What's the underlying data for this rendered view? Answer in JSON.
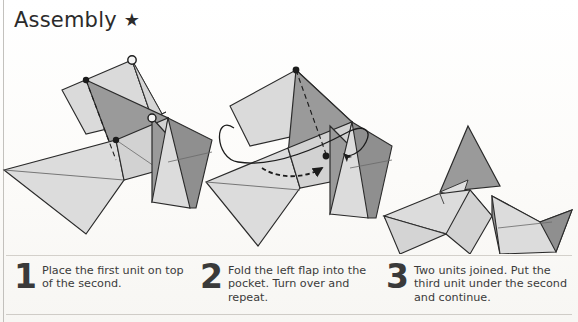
{
  "page": {
    "title": "Assembly",
    "title_marker": "★",
    "title_marker_icon": "star-icon"
  },
  "figures": [
    {
      "id": "figure-step-1",
      "name": "origami-units-overlap-diagram",
      "description": "Two sonobe-style paper units overlapping, first unit placed on top of the second",
      "annotations": [
        "vertex-circle-marker",
        "vertex-dot-marker",
        "hidden-edge-dashed-line"
      ]
    },
    {
      "id": "figure-step-2",
      "name": "origami-flap-into-pocket-diagram",
      "description": "Left flap being folded into the pocket with a turn-over loop arrow",
      "annotations": [
        "fold-arrow-dashed",
        "turn-over-loop-arrow",
        "vertex-dot-marker"
      ]
    },
    {
      "id": "figure-step-3",
      "name": "origami-two-units-joined-diagram",
      "description": "Two completed units joined together forming a peak",
      "annotations": []
    }
  ],
  "steps": [
    {
      "number": "1",
      "text": "Place the first unit on top of the second."
    },
    {
      "number": "2",
      "text": "Fold the left flap into the pocket. Turn over and repeat."
    },
    {
      "number": "3",
      "text": "Two units joined. Put the third unit under the second and continue."
    }
  ],
  "colors": {
    "paper_light": "#d8d8d8",
    "paper_mid": "#c4c4c4",
    "paper_dark": "#9a9a9a",
    "paper_darker": "#8d8d8d",
    "outline": "#262626",
    "crease": "#5b5b5b",
    "text": "#3b3b3b",
    "rule": "#d3d0cb",
    "background": "#fdfdfc"
  }
}
